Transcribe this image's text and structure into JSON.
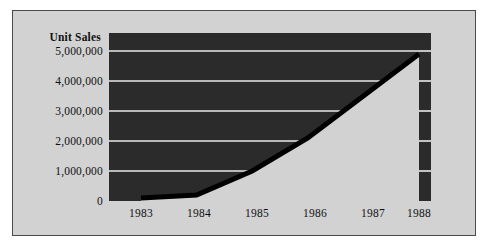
{
  "figure": {
    "background_color": "#d2d2d2",
    "border_color": "#4a4a4a",
    "page_background": "#ffffff"
  },
  "chart_data": {
    "type": "area",
    "title": "",
    "ylabel": "Unit Sales",
    "xlabel": "",
    "categories": [
      "1983",
      "1984",
      "1985",
      "1986",
      "1987",
      "1988"
    ],
    "x": [
      1983,
      1984,
      1985,
      1986,
      1987,
      1988
    ],
    "values": [
      100000,
      200000,
      1000000,
      2100000,
      3500000,
      4900000
    ],
    "series": [
      {
        "name": "Unit Sales",
        "values": [
          100000,
          200000,
          1000000,
          2100000,
          3500000,
          4900000
        ]
      }
    ],
    "ylim": [
      0,
      5600000
    ],
    "xlim": [
      1982.4,
      1988.4
    ],
    "yticks": [
      0,
      1000000,
      2000000,
      3000000,
      4000000,
      5000000
    ],
    "ytick_labels": [
      "0",
      "1,000,000",
      "2,000,000",
      "3,000,000",
      "4,000,000",
      "5,000,000"
    ],
    "xtick_labels": [
      "1983",
      "1984",
      "1985",
      "1986",
      "1987",
      "1988"
    ],
    "grid": true,
    "grid_axis": "y",
    "grid_color": "#e8e8e8",
    "legend": false,
    "legend_position": "none",
    "plot_background_color": "#2b2b2b",
    "area_fill_color": "#d2d2d2",
    "line_color": "#000000",
    "style_note": "inverted silhouette: dark plot panel with light-gray area fill beneath the curve"
  },
  "axis": {
    "y_title": "Unit Sales",
    "y_ticks": [
      {
        "label": "5,000,000",
        "value": 5000000
      },
      {
        "label": "4,000,000",
        "value": 4000000
      },
      {
        "label": "3,000,000",
        "value": 3000000
      },
      {
        "label": "2,000,000",
        "value": 2000000
      },
      {
        "label": "1,000,000",
        "value": 1000000
      },
      {
        "label": "0",
        "value": 0
      }
    ],
    "x_ticks": [
      {
        "label": "1983"
      },
      {
        "label": "1984"
      },
      {
        "label": "1985"
      },
      {
        "label": "1986"
      },
      {
        "label": "1987"
      },
      {
        "label": "1988"
      }
    ]
  }
}
